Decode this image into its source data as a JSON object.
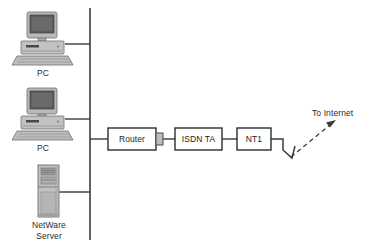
{
  "diagram": {
    "background_color": "#ffffff",
    "line_color": "#3a3a3a",
    "box_fill": "#ffffff",
    "box_stroke": "#1c1c1c",
    "device_gray": "#9a9a9a",
    "screen_gray": "#5d5d5d"
  },
  "lan": {
    "backbone_name": "lan-backbone",
    "nodes": [
      {
        "id": "pc-1",
        "icon": "desktop-computer-icon",
        "label": "PC",
        "x": 18,
        "y": 10,
        "drop_y": 44
      },
      {
        "id": "pc-2",
        "icon": "desktop-computer-icon",
        "label": "PC",
        "x": 18,
        "y": 86,
        "drop_y": 119
      },
      {
        "id": "netware-server",
        "icon": "server-tower-icon",
        "label": "NetWare\nServer",
        "x": 36,
        "y": 163,
        "drop_y": 192
      }
    ]
  },
  "chain": {
    "boxes": [
      {
        "id": "router",
        "label": "Router",
        "x": 108,
        "y": 128,
        "w": 48,
        "h": 22
      },
      {
        "id": "isdn-ta",
        "label": "ISDN TA",
        "x": 175,
        "y": 128,
        "w": 47,
        "h": 22
      },
      {
        "id": "nt1",
        "label": "NT1",
        "x": 237,
        "y": 128,
        "w": 34,
        "h": 22
      }
    ],
    "connector_nub": {
      "name": "router-port-connector",
      "x": 156,
      "y": 133,
      "w": 7,
      "h": 12
    }
  },
  "internet": {
    "label": "To Internet",
    "label_x": 312,
    "label_y": 108,
    "arrow_name": "dashed-arrow-to-internet",
    "lightning_name": "wan-link-zigzag"
  }
}
